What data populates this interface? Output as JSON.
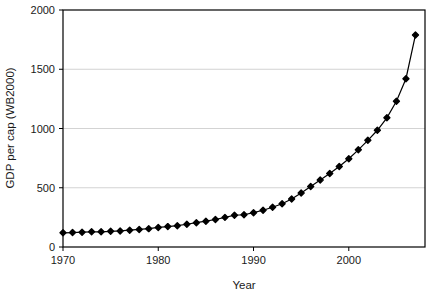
{
  "chart_data": {
    "type": "line",
    "title": "",
    "subtitle": "",
    "xlabel": "Year",
    "ylabel": "GDP per cap (WB2000)",
    "xlim": [
      1970,
      2008
    ],
    "ylim": [
      0,
      2000
    ],
    "xticks": [
      1970,
      1980,
      1990,
      2000
    ],
    "xtick_labels": [
      "1970",
      "1980",
      "1990",
      "2000"
    ],
    "yticks": [
      0,
      500,
      1000,
      1500,
      2000
    ],
    "ytick_labels": [
      "0",
      "500",
      "1000",
      "1500",
      "2000"
    ],
    "grid": "horizontal",
    "grid_color": "#c8c8c8",
    "legend": "none",
    "marker": "filled-diamond",
    "marker_color": "#000000",
    "line_color": "#000000",
    "plot_border_color": "#000000",
    "background_color": "#ffffff",
    "x": [
      1970,
      1971,
      1972,
      1973,
      1974,
      1975,
      1976,
      1977,
      1978,
      1979,
      1980,
      1981,
      1982,
      1983,
      1984,
      1985,
      1986,
      1987,
      1988,
      1989,
      1990,
      1991,
      1992,
      1993,
      1994,
      1995,
      1996,
      1997,
      1998,
      1999,
      2000,
      2001,
      2002,
      2003,
      2004,
      2005,
      2006,
      2007
    ],
    "values": [
      120,
      122,
      125,
      128,
      128,
      132,
      136,
      142,
      148,
      155,
      165,
      172,
      180,
      192,
      205,
      218,
      232,
      250,
      268,
      272,
      290,
      310,
      335,
      365,
      405,
      455,
      510,
      565,
      620,
      680,
      745,
      820,
      900,
      985,
      1090,
      1230,
      1420,
      1790
    ],
    "series": [
      {
        "name": "GDP per cap (WB2000)",
        "values": [
          120,
          122,
          125,
          128,
          128,
          132,
          136,
          142,
          148,
          155,
          165,
          172,
          180,
          192,
          205,
          218,
          232,
          250,
          268,
          272,
          290,
          310,
          335,
          365,
          405,
          455,
          510,
          565,
          620,
          680,
          745,
          820,
          900,
          985,
          1090,
          1230,
          1420,
          1790
        ]
      }
    ],
    "annotations": []
  },
  "labels": {
    "y_axis_title": "GDP per cap (WB2000)",
    "x_axis_title": "Year"
  }
}
